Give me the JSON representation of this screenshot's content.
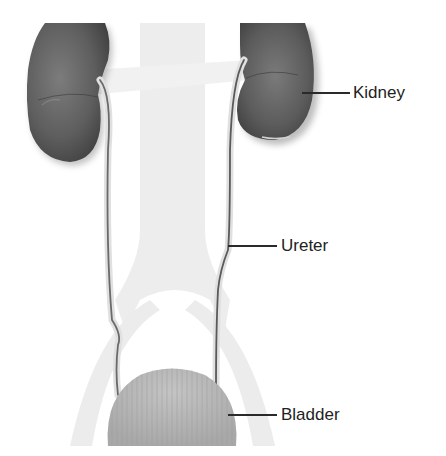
{
  "diagram": {
    "labels": {
      "kidney": "Kidney",
      "ureter": "Ureter",
      "bladder": "Bladder"
    },
    "colors": {
      "kidney": "#5a5a5a",
      "kidney_highlight": "#7e7e7e",
      "ureter": "#6a6a6a",
      "bladder": "#b5b5b5",
      "background_body": "#ececec",
      "label_text": "#222222",
      "leader_line": "#2a2a2a"
    }
  }
}
